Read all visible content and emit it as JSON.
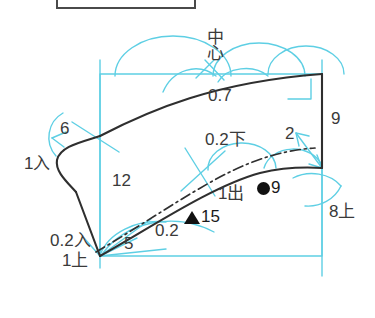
{
  "canvas": {
    "width": 375,
    "height": 318,
    "background": "#ffffff"
  },
  "colors": {
    "guide_cyan": "#5ecfe4",
    "outline_black": "#2f2f2f",
    "text_gray": "#3a3a3a",
    "marker_black": "#111111",
    "topbox_border": "#4a4a4a"
  },
  "top_box": {
    "name": "cropped-legend-box",
    "text": ""
  },
  "labels": {
    "center": {
      "text": "中心",
      "chars": [
        "中",
        "心"
      ]
    },
    "top_seam": {
      "text": "0.7"
    },
    "left_upper": {
      "text": "6"
    },
    "left_entry": {
      "text": "1入"
    },
    "body_width": {
      "text": "12"
    },
    "bottom_entry": {
      "text": "0.2入"
    },
    "bottom_top": {
      "text": "1上"
    },
    "bottom_five": {
      "text": "5"
    },
    "bottom_hem": {
      "text": "0.2"
    },
    "mid_lower": {
      "text": "0.2下"
    },
    "right_two": {
      "text": "2"
    },
    "right_nine": {
      "text": "9"
    },
    "right_eight_up": {
      "text": "8上"
    },
    "one_out": {
      "text": "1出"
    }
  },
  "markers": [
    {
      "glyph": "circle",
      "glyph_name": "filled-circle-marker",
      "value": "9"
    },
    {
      "glyph": "triangle",
      "glyph_name": "filled-triangle-marker",
      "value": "15"
    }
  ]
}
